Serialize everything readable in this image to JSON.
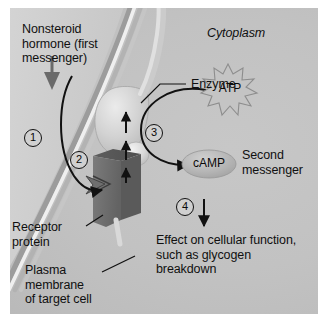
{
  "figure": {
    "colors": {
      "cytoplasm": "#c2c2c2",
      "membrane_light": "#e8e8e8",
      "membrane_dark": "#9a9a9a",
      "receptor": "#6e6e6e",
      "enzyme": "#c8c8c8",
      "camp": "#b0b0b0",
      "atp_outline": "#8d8d8d",
      "text": "#101010",
      "arrow": "#111111"
    }
  },
  "labels": {
    "hormone": "Nonsteroid\nhormone (first\nmessenger)",
    "cytoplasm": "Cytoplasm",
    "enzyme": "Enzyme",
    "atp": "ATP",
    "camp": "cAMP",
    "second_messenger": "Second\nmessenger",
    "receptor_protein": "Receptor\nprotein",
    "plasma_membrane": "Plasma\nmembrane\nof target cell",
    "effect": "Effect on cellular function,\nsuch as glycogen\nbreakdown"
  },
  "steps": [
    {
      "id": "step-1",
      "number": "1"
    },
    {
      "id": "step-2",
      "number": "2"
    },
    {
      "id": "step-3",
      "number": "3"
    },
    {
      "id": "step-4",
      "number": "4"
    }
  ],
  "icons": {
    "hormone_arrow": "down-arrow-icon",
    "step1_arrow": "curved-arrow-icon",
    "activation_arrows": "up-arrow-icon",
    "step3_arrow": "curved-arrow-icon",
    "camp_arrow": "right-arrow-icon",
    "step4_arrow": "down-arrow-icon",
    "atp_burst": "starburst-icon"
  }
}
